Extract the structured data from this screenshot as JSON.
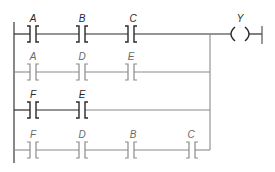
{
  "diagram": {
    "type": "ladder-logic",
    "colors": {
      "dark": "#2a2a2a",
      "gray": "#8a8a8a"
    },
    "rungs": [
      {
        "id": 1,
        "tone": "dark",
        "contacts": [
          "A",
          "B",
          "C"
        ],
        "output": "Y"
      },
      {
        "id": 2,
        "tone": "gray",
        "contacts": [
          "A",
          "D",
          "E"
        ]
      },
      {
        "id": 3,
        "tone": "dark",
        "contacts": [
          "F",
          "E"
        ]
      },
      {
        "id": 4,
        "tone": "gray",
        "contacts": [
          "F",
          "D",
          "B",
          "C"
        ]
      }
    ],
    "coil": {
      "label": "Y"
    },
    "labels": {
      "r1c1": "A",
      "r1c2": "B",
      "r1c3": "C",
      "r2c1": "A",
      "r2c2": "D",
      "r2c3": "E",
      "r3c1": "F",
      "r3c2": "E",
      "r4c1": "F",
      "r4c2": "D",
      "r4c3": "B",
      "r4c4": "C",
      "coil": "Y"
    }
  }
}
